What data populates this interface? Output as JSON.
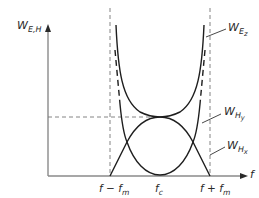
{
  "diagram": {
    "title": "",
    "axes": {
      "y_label": {
        "base": "W",
        "sub": "E,H"
      },
      "x_label": "f"
    },
    "x_ticks": [
      {
        "id": "f-minus-fm",
        "base": "f − f",
        "sub": "m"
      },
      {
        "id": "fc",
        "base": "f",
        "sub": "c"
      },
      {
        "id": "f-plus-fm",
        "base": "f + f",
        "sub": "m"
      }
    ],
    "curves": [
      {
        "id": "W_Ez",
        "base": "W",
        "sub": "E",
        "subsub": "z",
        "style": "solid",
        "shape": "U-shaped, minimum at f_c touching the crossing level"
      },
      {
        "id": "W_Hy",
        "base": "W",
        "sub": "H",
        "subsub": "y",
        "style": "solid",
        "shape": "arch, maximum at f_c, zero at f ± f_m"
      },
      {
        "id": "W_Hx",
        "base": "W",
        "sub": "H",
        "subsub": "x",
        "style": "solid + dashed continuation",
        "shape": "U-shaped, zero at f_c"
      }
    ],
    "guides": {
      "vertical_dashed": [
        "f − f_m",
        "f + f_m"
      ],
      "horizontal_dashed": "level where W_Ez and W_Hy meet at f_c"
    },
    "colors": {
      "line": "#1e1e1e",
      "axis": "#8a8a8a",
      "dashed": "#777777"
    }
  }
}
